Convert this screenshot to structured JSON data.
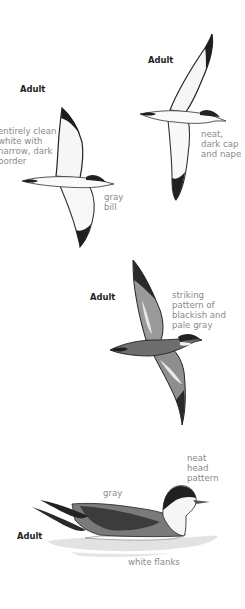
{
  "plate": {
    "figures": [
      {
        "id": "top-right-flight",
        "age_label": "Adult",
        "annotations": [
          {
            "lines": [
              "neat,",
              "dark cap",
              "and nape"
            ]
          }
        ]
      },
      {
        "id": "top-left-flight",
        "age_label": "Adult",
        "annotations": [
          {
            "lines": [
              "entirely clean",
              "white with",
              "narrow, dark",
              "border"
            ]
          },
          {
            "lines": [
              "gray",
              "bill"
            ]
          }
        ]
      },
      {
        "id": "upperside-flight",
        "age_label": "Adult",
        "annotations": [
          {
            "lines": [
              "striking",
              "pattern of",
              "blackish and",
              "pale gray"
            ]
          }
        ]
      },
      {
        "id": "swimming",
        "age_label": "Adult",
        "annotations": [
          {
            "lines": [
              "neat",
              "head",
              "pattern"
            ]
          },
          {
            "lines": [
              "gray"
            ]
          },
          {
            "lines": [
              "white flanks"
            ]
          }
        ]
      }
    ]
  },
  "colors": {
    "label_text": "#8a8a8a",
    "age_text": "#1e1e1e",
    "dark_plumage": "#2a2a2a",
    "mid_gray": "#7a7a7a",
    "pale": "#f4f4f4",
    "water": "#d9dcdc"
  }
}
